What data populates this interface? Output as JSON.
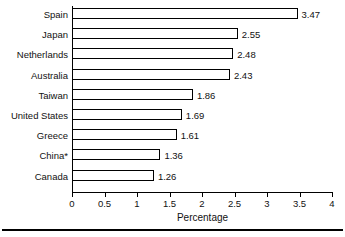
{
  "chart_data": {
    "type": "bar",
    "orientation": "horizontal",
    "title": "",
    "xlabel": "Percentage",
    "ylabel": "",
    "xlim": [
      0,
      4
    ],
    "xticks": [
      "0",
      "0.5",
      "1",
      "1.5",
      "2",
      "2.5",
      "3",
      "3.5",
      "4"
    ],
    "xtick_values": [
      0,
      0.5,
      1,
      1.5,
      2,
      2.5,
      3,
      3.5,
      4
    ],
    "grid": false,
    "legend": null,
    "categories": [
      "Spain",
      "Japan",
      "Netherlands",
      "Australia",
      "Taiwan",
      "United States",
      "Greece",
      "China*",
      "Canada"
    ],
    "values": [
      3.47,
      2.55,
      2.48,
      2.43,
      1.86,
      1.69,
      1.61,
      1.36,
      1.26
    ],
    "data_labels": [
      "3.47",
      "2.55",
      "2.48",
      "2.43",
      "1.86",
      "1.69",
      "1.61",
      "1.36",
      "1.26"
    ],
    "annotations": [
      "* asterisk on China category label"
    ],
    "bar_fill": "#ffffff",
    "bar_stroke": "#000000"
  },
  "colors": {
    "axis": "#000000",
    "text": "#111111",
    "background": "#ffffff",
    "bar_fill": "#ffffff",
    "bar_stroke": "#000000"
  }
}
